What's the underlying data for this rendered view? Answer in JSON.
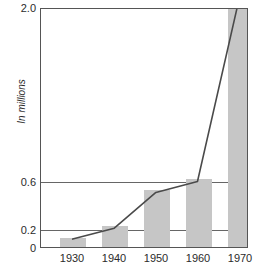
{
  "chart_data": {
    "type": "bar",
    "title": "",
    "subtitle": "",
    "xlabel": "",
    "ylabel": "In millions",
    "categories": [
      "1930",
      "1940",
      "1950",
      "1960",
      "1970"
    ],
    "values": [
      0.11,
      0.22,
      0.51,
      0.61,
      2.6
    ],
    "series": [
      {
        "name": "bars",
        "type": "bar",
        "values": [
          0.11,
          0.22,
          0.51,
          0.61,
          2.6
        ]
      },
      {
        "name": "trend",
        "type": "line",
        "values": [
          0.11,
          0.22,
          0.51,
          0.61,
          2.6
        ]
      }
    ],
    "ylim": [
      0,
      2.0
    ],
    "y_ticks": [
      "0",
      "0.2",
      "0.6",
      "2.0"
    ],
    "y_tick_values": [
      0,
      0.2,
      0.6,
      2.0
    ],
    "y_axis_note": "broken / non-linear scale",
    "x_ticks": [
      "1930",
      "1940",
      "1950",
      "1960",
      "1970"
    ],
    "grid": true,
    "gridlines_at": [
      0.2,
      0.6
    ],
    "legend": false,
    "legend_position": "none",
    "last_bar_clipped": true,
    "annotations": []
  },
  "axis": {
    "y_label": "In millions",
    "y_ticks": [
      {
        "label": "2.0",
        "top": 2
      },
      {
        "label": "0.6",
        "top": 176
      },
      {
        "label": "0.2",
        "top": 224
      },
      {
        "label": "0",
        "top": 242
      }
    ],
    "x_ticks": [
      {
        "label": "1930",
        "left": 32
      },
      {
        "label": "1940",
        "left": 74
      },
      {
        "label": "1950",
        "left": 116
      },
      {
        "label": "1960",
        "left": 158
      },
      {
        "label": "1970",
        "left": 200
      }
    ]
  },
  "geometry": {
    "bars": [
      {
        "category": "1930",
        "left": 19,
        "width": 26,
        "top": 231,
        "height": 9
      },
      {
        "category": "1940",
        "left": 61,
        "width": 26,
        "top": 219,
        "height": 21
      },
      {
        "category": "1950",
        "left": 103,
        "width": 26,
        "top": 183,
        "height": 57
      },
      {
        "category": "1960",
        "left": 145,
        "width": 26,
        "top": 172,
        "height": 68
      },
      {
        "category": "1970",
        "left": 187,
        "width": 26,
        "top": -8,
        "height": 248
      }
    ],
    "line_points": "32,232 74,221 116,185 158,174 200,-10"
  },
  "colors": {
    "bar_fill": "#c6c6c6",
    "line": "#4a4a4a",
    "frame": "#555555",
    "grid": "#666666",
    "text": "#2b2b2b",
    "background": "#ffffff"
  }
}
